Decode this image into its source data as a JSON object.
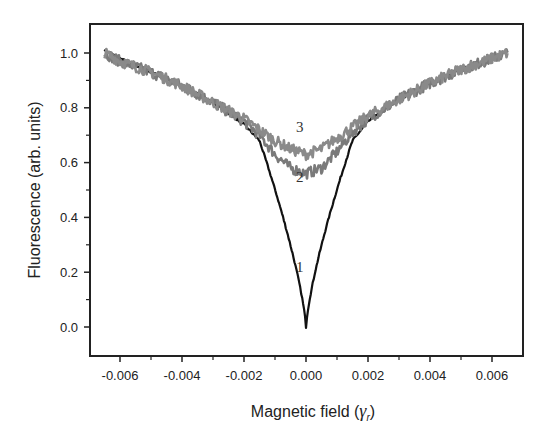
{
  "chart_data": {
    "type": "line",
    "title": "",
    "xlabel": "Magnetic field (γr)",
    "xlabel_main": "Magnetic field (",
    "xlabel_symbol": "γ",
    "xlabel_sub": "r",
    "xlabel_close": ")",
    "ylabel": "Fluorescence (arb. units)",
    "xlim": [
      -0.007,
      0.007
    ],
    "ylim": [
      -0.1,
      1.1
    ],
    "x_ticks": [
      "-0.006",
      "-0.004",
      "-0.002",
      "0.000",
      "0.002",
      "0.004",
      "0.006"
    ],
    "y_ticks": [
      "0.0",
      "0.2",
      "0.4",
      "0.6",
      "0.8",
      "1.0"
    ],
    "grid": false,
    "legend": "none (curves labeled inline 1, 2, 3)",
    "x": [
      -0.0065,
      -0.006,
      -0.005,
      -0.004,
      -0.003,
      -0.002,
      -0.0015,
      -0.001,
      -0.0005,
      -0.00025,
      0.0,
      0.00025,
      0.0005,
      0.001,
      0.0015,
      0.002,
      0.003,
      0.004,
      0.005,
      0.006,
      0.0065
    ],
    "series": [
      {
        "name": "1",
        "color": "#111111",
        "values": [
          1.01,
          0.98,
          0.93,
          0.88,
          0.82,
          0.74,
          0.68,
          0.57,
          0.38,
          0.2,
          0.0,
          0.2,
          0.38,
          0.57,
          0.68,
          0.75,
          0.83,
          0.89,
          0.94,
          0.98,
          1.01
        ]
      },
      {
        "name": "2",
        "color": "#7a7a7a",
        "values": [
          1.0,
          0.97,
          0.93,
          0.88,
          0.82,
          0.75,
          0.7,
          0.63,
          0.58,
          0.57,
          0.56,
          0.57,
          0.58,
          0.64,
          0.71,
          0.76,
          0.83,
          0.89,
          0.94,
          0.98,
          1.0
        ]
      },
      {
        "name": "3",
        "color": "#8a8a8a",
        "values": [
          1.0,
          0.97,
          0.93,
          0.88,
          0.82,
          0.76,
          0.72,
          0.68,
          0.65,
          0.64,
          0.63,
          0.64,
          0.65,
          0.69,
          0.73,
          0.77,
          0.83,
          0.89,
          0.94,
          0.98,
          1.0
        ]
      }
    ],
    "annotations": [
      {
        "text": "1",
        "x": -0.0002,
        "y": 0.2
      },
      {
        "text": "2",
        "x": -0.0002,
        "y": 0.53
      },
      {
        "text": "3",
        "x": -0.0002,
        "y": 0.71
      }
    ]
  }
}
